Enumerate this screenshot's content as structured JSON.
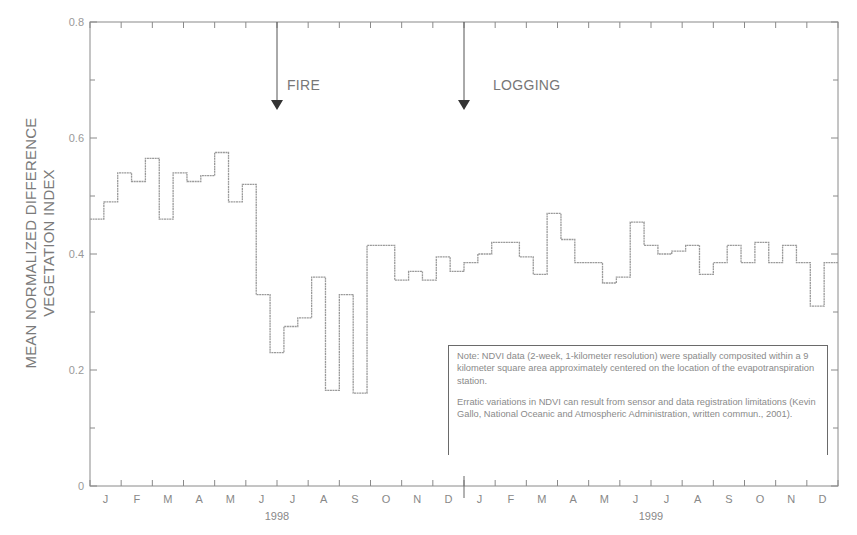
{
  "chart_data": {
    "type": "line",
    "step": true,
    "title": "",
    "xlabel": "",
    "ylabel": "MEAN NORMALIZED DIFFERENCE VEGETATION INDEX",
    "ylabel_lines": [
      "MEAN NORMALIZED DIFFERENCE",
      "VEGETATION INDEX"
    ],
    "ylim": [
      0,
      0.8
    ],
    "yticks": [
      0,
      0.2,
      0.4,
      0.6,
      0.8
    ],
    "ytick_labels": [
      "0",
      "0.2",
      "0.4",
      "0.6",
      "0.8"
    ],
    "grid": false,
    "legend": null,
    "x_months": [
      "J",
      "F",
      "M",
      "A",
      "M",
      "J",
      "J",
      "A",
      "S",
      "O",
      "N",
      "D",
      "J",
      "F",
      "M",
      "A",
      "M",
      "J",
      "J",
      "A",
      "S",
      "O",
      "N",
      "D"
    ],
    "x_years": [
      {
        "label": "1998",
        "month_index": 6
      },
      {
        "label": "1999",
        "month_index": 18
      }
    ],
    "period": "2-week composites (2 per month)",
    "series": [
      {
        "name": "NDVI",
        "values": [
          0.46,
          0.49,
          0.54,
          0.525,
          0.565,
          0.46,
          0.54,
          0.525,
          0.535,
          0.575,
          0.49,
          0.52,
          0.33,
          0.23,
          0.275,
          0.29,
          0.36,
          0.165,
          0.33,
          0.16,
          0.415,
          0.415,
          0.355,
          0.37,
          0.355,
          0.395,
          0.37,
          0.385,
          0.4,
          0.42,
          0.42,
          0.395,
          0.365,
          0.47,
          0.425,
          0.385,
          0.385,
          0.35,
          0.36,
          0.455,
          0.415,
          0.4,
          0.405,
          0.415,
          0.365,
          0.385,
          0.415,
          0.385,
          0.42,
          0.385,
          0.415,
          0.385,
          0.31,
          0.385
        ]
      }
    ],
    "annotations": [
      {
        "label": "FIRE",
        "month_index": 6,
        "type": "arrow-down"
      },
      {
        "label": "LOGGING",
        "month_index": 12,
        "type": "arrow-down"
      }
    ],
    "note_box": [
      "Note: NDVI data (2-week, 1-kilometer resolution) were spatially composited within a 9 kilometer square area approximately centered on the location of the evapotranspiration station.",
      "Erratic variations in NDVI can result from sensor and data registration limitations (Kevin Gallo, National Oceanic and Atmospheric Administration, written commun., 2001)."
    ]
  },
  "colors": {
    "axis": "#8a8a8a",
    "line": "#9a9a9a",
    "text": "#777777",
    "arrow": "#333333"
  }
}
